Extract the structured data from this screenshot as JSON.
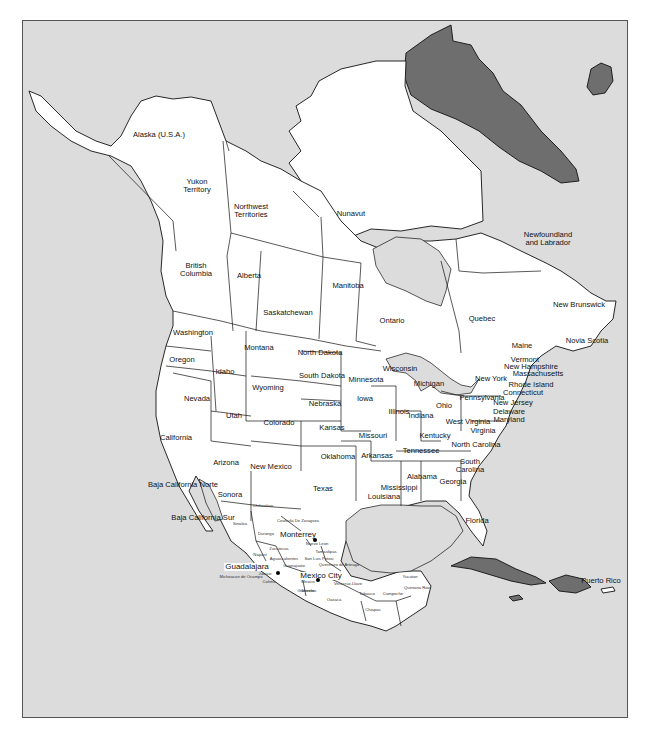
{
  "map": {
    "title": "North America political map",
    "colors": {
      "water": "#dcdcdc",
      "land": "#ffffff",
      "other_countries": "#6e6e6e",
      "lines": "#111111"
    },
    "countries": {
      "usa_alaska": "Alaska (U.S.A.)"
    },
    "canada": [
      {
        "id": "yukon",
        "label": "Yukon\nTerritory",
        "x": 196,
        "y": 181
      },
      {
        "id": "nwt",
        "label": "Northwest\nTerritories",
        "x": 250,
        "y": 206
      },
      {
        "id": "nunavut",
        "label": "Nunavut",
        "x": 350,
        "y": 213
      },
      {
        "id": "nl",
        "label": "Newfoundland\nand Labrador",
        "x": 547,
        "y": 234
      },
      {
        "id": "bc",
        "label": "British\nColumbia",
        "x": 195,
        "y": 265
      },
      {
        "id": "alberta",
        "label": "Alberta",
        "x": 248,
        "y": 275
      },
      {
        "id": "manitoba",
        "label": "Manitoba",
        "x": 347,
        "y": 285
      },
      {
        "id": "saskatchewan",
        "label": "Saskatchewan",
        "x": 287,
        "y": 312
      },
      {
        "id": "ontario",
        "label": "Ontario",
        "x": 391,
        "y": 320
      },
      {
        "id": "quebec",
        "label": "Quebec",
        "x": 481,
        "y": 318
      },
      {
        "id": "new_brunswick",
        "label": "New Brunswick",
        "x": 578,
        "y": 304
      },
      {
        "id": "nova_scotia",
        "label": "Novia Scotia",
        "x": 586,
        "y": 340
      }
    ],
    "usa": [
      {
        "id": "alaska",
        "label": "Alaska (U.S.A.)",
        "x": 158,
        "y": 134
      },
      {
        "id": "washington",
        "label": "Washington",
        "x": 192,
        "y": 332
      },
      {
        "id": "oregon",
        "label": "Oregon",
        "x": 181,
        "y": 359
      },
      {
        "id": "montana",
        "label": "Montana",
        "x": 258,
        "y": 347
      },
      {
        "id": "idaho",
        "label": "Idaho",
        "x": 224,
        "y": 371
      },
      {
        "id": "north_dakota",
        "label": "North Dakota",
        "x": 319,
        "y": 352
      },
      {
        "id": "south_dakota",
        "label": "South Dakota",
        "x": 321,
        "y": 375
      },
      {
        "id": "wyoming",
        "label": "Wyoming",
        "x": 267,
        "y": 387
      },
      {
        "id": "minnesota",
        "label": "Minnesota",
        "x": 365,
        "y": 379
      },
      {
        "id": "wisconsin",
        "label": "Wisconsin",
        "x": 399,
        "y": 368
      },
      {
        "id": "michigan",
        "label": "Michigan",
        "x": 428,
        "y": 383
      },
      {
        "id": "new_york",
        "label": "New York",
        "x": 490,
        "y": 378
      },
      {
        "id": "vermont",
        "label": "Vermont",
        "x": 524,
        "y": 359
      },
      {
        "id": "new_hampshire",
        "label": "New Hampshire",
        "x": 530,
        "y": 366
      },
      {
        "id": "massachusetts",
        "label": "Massachusetts",
        "x": 537,
        "y": 373
      },
      {
        "id": "rhode_island",
        "label": "Rhode Island",
        "x": 530,
        "y": 384
      },
      {
        "id": "connecticut",
        "label": "Connecticut",
        "x": 522,
        "y": 392
      },
      {
        "id": "new_jersey",
        "label": "New Jersey",
        "x": 512,
        "y": 402
      },
      {
        "id": "delaware",
        "label": "Delaware",
        "x": 508,
        "y": 411
      },
      {
        "id": "maryland",
        "label": "Maryland",
        "x": 508,
        "y": 419
      },
      {
        "id": "maine",
        "label": "Maine",
        "x": 521,
        "y": 345
      },
      {
        "id": "nevada",
        "label": "Nevada",
        "x": 196,
        "y": 398
      },
      {
        "id": "utah",
        "label": "Utah",
        "x": 233,
        "y": 415
      },
      {
        "id": "colorado",
        "label": "Colorado",
        "x": 278,
        "y": 422
      },
      {
        "id": "nebraska",
        "label": "Nebraska",
        "x": 324,
        "y": 403
      },
      {
        "id": "iowa",
        "label": "Iowa",
        "x": 364,
        "y": 398
      },
      {
        "id": "illinois",
        "label": "Illinois",
        "x": 398,
        "y": 411
      },
      {
        "id": "indiana",
        "label": "Indiana",
        "x": 420,
        "y": 415
      },
      {
        "id": "ohio",
        "label": "Ohio",
        "x": 443,
        "y": 405
      },
      {
        "id": "pennsylvania",
        "label": "Pennsylvania",
        "x": 481,
        "y": 397
      },
      {
        "id": "west_virginia",
        "label": "West Virginia",
        "x": 467,
        "y": 421
      },
      {
        "id": "virginia",
        "label": "Virginia",
        "x": 482,
        "y": 430
      },
      {
        "id": "kansas",
        "label": "Kansas",
        "x": 331,
        "y": 427
      },
      {
        "id": "missouri",
        "label": "Missouri",
        "x": 372,
        "y": 435
      },
      {
        "id": "kentucky",
        "label": "Kentucky",
        "x": 434,
        "y": 435
      },
      {
        "id": "california",
        "label": "California",
        "x": 175,
        "y": 437
      },
      {
        "id": "tennessee",
        "label": "Tennessee",
        "x": 420,
        "y": 450
      },
      {
        "id": "north_carolina",
        "label": "North Carolina",
        "x": 475,
        "y": 444
      },
      {
        "id": "arizona",
        "label": "Arizona",
        "x": 225,
        "y": 462
      },
      {
        "id": "new_mexico",
        "label": "New Mexico",
        "x": 270,
        "y": 466
      },
      {
        "id": "oklahoma",
        "label": "Oklahoma",
        "x": 337,
        "y": 456
      },
      {
        "id": "arkansas",
        "label": "Arkansas",
        "x": 376,
        "y": 455
      },
      {
        "id": "south_carolina",
        "label": "South\nCarolina",
        "x": 469,
        "y": 461
      },
      {
        "id": "alabama",
        "label": "Alabama",
        "x": 421,
        "y": 476
      },
      {
        "id": "georgia",
        "label": "Georgia",
        "x": 452,
        "y": 481
      },
      {
        "id": "texas",
        "label": "Texas",
        "x": 322,
        "y": 488
      },
      {
        "id": "mississippi",
        "label": "Mississippi",
        "x": 398,
        "y": 487
      },
      {
        "id": "louisiana",
        "label": "Louisiana",
        "x": 383,
        "y": 496
      },
      {
        "id": "florida",
        "label": "Florida",
        "x": 476,
        "y": 520
      }
    ],
    "mexico": [
      {
        "id": "baja_norte",
        "label": "Baja California Norte",
        "x": 182,
        "y": 484
      },
      {
        "id": "sonora",
        "label": "Sonora",
        "x": 229,
        "y": 494
      },
      {
        "id": "baja_sur",
        "label": "Baja California Sur",
        "x": 202,
        "y": 517
      },
      {
        "id": "chihuahua",
        "label": "Chihuahua",
        "x": 262,
        "y": 507,
        "small": true
      },
      {
        "id": "coahuila",
        "label": "Coahuila De Zaragoza",
        "x": 297,
        "y": 522,
        "small": true
      },
      {
        "id": "sinaloa",
        "label": "Sinaloa",
        "x": 239,
        "y": 525,
        "small": true
      },
      {
        "id": "durango",
        "label": "Durango",
        "x": 265,
        "y": 535,
        "small": true
      },
      {
        "id": "nuevo_leon",
        "label": "Nuevo Leon",
        "x": 316,
        "y": 545,
        "small": true
      },
      {
        "id": "zacatecas",
        "label": "Zacatecas",
        "x": 278,
        "y": 550,
        "small": true
      },
      {
        "id": "tamaulipas",
        "label": "Tamaulipas",
        "x": 325,
        "y": 553,
        "small": true
      },
      {
        "id": "nayarit",
        "label": "Nayarit",
        "x": 259,
        "y": 556,
        "small": true
      },
      {
        "id": "sl_potosi",
        "label": "San Luis Potosi",
        "x": 318,
        "y": 560,
        "small": true
      },
      {
        "id": "aguascalientes",
        "label": "Aguascalientes",
        "x": 283,
        "y": 560,
        "small": true
      },
      {
        "id": "jalisco",
        "label": "Jalisco",
        "x": 264,
        "y": 575,
        "small": true
      },
      {
        "id": "guanajuato",
        "label": "Guanajuato",
        "x": 293,
        "y": 567,
        "small": true
      },
      {
        "id": "queretaro",
        "label": "Queretaro de Arteaga",
        "x": 338,
        "y": 566,
        "small": true
      },
      {
        "id": "michoacan",
        "label": "Michoacan de Ocampo",
        "x": 240,
        "y": 578,
        "small": true
      },
      {
        "id": "colima",
        "label": "Colima",
        "x": 268,
        "y": 583,
        "small": true
      },
      {
        "id": "mexico_state",
        "label": "Mexico",
        "x": 307,
        "y": 583,
        "small": true
      },
      {
        "id": "tlaxcala",
        "label": "Tlaxcala",
        "x": 326,
        "y": 577,
        "small": true
      },
      {
        "id": "morelos",
        "label": "Morelos",
        "x": 308,
        "y": 592,
        "small": true
      },
      {
        "id": "veracruz",
        "label": "Veracruz-Llave",
        "x": 347,
        "y": 585,
        "small": true
      },
      {
        "id": "guerrero",
        "label": "Guerrero",
        "x": 305,
        "y": 592,
        "small": true
      },
      {
        "id": "oaxaca",
        "label": "Oaxaca",
        "x": 333,
        "y": 601,
        "small": true
      },
      {
        "id": "chiapas",
        "label": "Chiapas",
        "x": 372,
        "y": 611,
        "small": true
      },
      {
        "id": "tabasco",
        "label": "Tabasco",
        "x": 366,
        "y": 595,
        "small": true
      },
      {
        "id": "campeche",
        "label": "Campeche",
        "x": 392,
        "y": 595,
        "small": true
      },
      {
        "id": "yucatan",
        "label": "Yucatan",
        "x": 409,
        "y": 578,
        "small": true
      },
      {
        "id": "quintana_roo",
        "label": "Quintana Roo",
        "x": 416,
        "y": 589,
        "small": true
      }
    ],
    "cities": [
      {
        "id": "monterrey",
        "label": "Monterrey",
        "x": 297,
        "y": 534,
        "dot_x": 314,
        "dot_y": 539
      },
      {
        "id": "guadalajara",
        "label": "Guadalajara",
        "x": 246,
        "y": 566,
        "dot_x": 277,
        "dot_y": 572
      },
      {
        "id": "mexico_city",
        "label": "Mexico City",
        "x": 320,
        "y": 575,
        "dot_x": 317,
        "dot_y": 579
      }
    ],
    "other": [
      {
        "id": "puerto_rico",
        "label": "Puerto Rico",
        "x": 600,
        "y": 580
      }
    ]
  }
}
